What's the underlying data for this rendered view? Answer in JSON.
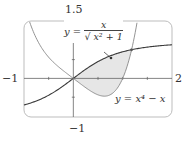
{
  "chart_data": {
    "type": "line",
    "title": "",
    "xlabel": "",
    "ylabel": "",
    "xlim": [
      -1,
      2
    ],
    "ylim": [
      -1,
      1.5
    ],
    "grid": false,
    "tick_labels": {
      "x_left": "−1",
      "x_right": "2",
      "y_top": "1.5",
      "y_bottom": "−1"
    },
    "x_ticks": [
      -0.5,
      0,
      0.5,
      1,
      1.5
    ],
    "y_ticks": [
      -0.5,
      0.5,
      1
    ],
    "series": [
      {
        "name": "y = x / sqrt(x^2 + 1)",
        "color": "#3a3a3a",
        "x": [
          -1,
          -0.75,
          -0.5,
          -0.25,
          0,
          0.25,
          0.5,
          0.75,
          1,
          1.25,
          1.5,
          1.75,
          2
        ],
        "y": [
          -0.707,
          -0.6,
          -0.447,
          -0.243,
          0,
          0.243,
          0.447,
          0.6,
          0.707,
          0.781,
          0.832,
          0.868,
          0.894
        ]
      },
      {
        "name": "y = x^4 - x",
        "color": "#888888",
        "x": [
          -0.885,
          -0.75,
          -0.6,
          -0.5,
          -0.25,
          0,
          0.25,
          0.5,
          0.63,
          0.75,
          0.9,
          1,
          1.1,
          1.2,
          1.29
        ],
        "y": [
          1.5,
          1.066,
          0.73,
          0.5625,
          0.254,
          0,
          -0.246,
          -0.4375,
          -0.472,
          -0.434,
          -0.244,
          0,
          0.364,
          0.874,
          1.479
        ]
      }
    ],
    "shaded_region": {
      "between": [
        "y = x / sqrt(x^2 + 1)",
        "y = x^4 - x"
      ],
      "x_range": [
        0,
        1.18
      ],
      "color": "#e6e6e6"
    },
    "intersection_points": [
      {
        "x": 0,
        "y": 0
      },
      {
        "x": 1.18,
        "y": 0.76
      }
    ],
    "annotations": [
      {
        "text": "y = x / √(x² + 1)",
        "target": "sigmoid curve"
      },
      {
        "text": "y = x⁴ − x",
        "target": "quartic curve"
      }
    ]
  },
  "labels": {
    "eq1_lhs": "y =",
    "eq1_num": "x",
    "eq1_den": "√ x² + 1",
    "eq2": "y = x⁴ − x",
    "x_left": "−1",
    "x_right": "2",
    "y_top": "1.5",
    "y_bottom": "−1"
  }
}
